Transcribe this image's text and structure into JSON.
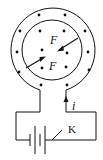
{
  "diagram": {
    "type": "physics-circuit",
    "labels": {
      "force_upper": "F",
      "force_lower": "F",
      "current": "i",
      "switch": "K"
    },
    "field_symbol": "dot (out of page)",
    "colors": {
      "line": "#111111",
      "background": "#ffffff"
    },
    "geometry": {
      "ring_center": [
        52,
        50
      ],
      "outer_radius": 42,
      "inner_radius": 30
    }
  }
}
